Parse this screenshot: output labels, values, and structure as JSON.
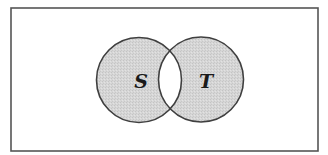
{
  "diagram": {
    "type": "venn",
    "universe": {
      "x": 11,
      "y": 8,
      "width": 307,
      "height": 143,
      "stroke": "#555555"
    },
    "sets": [
      {
        "id": "S",
        "label": "S",
        "cx": 139,
        "cy": 80,
        "r": 42.5
      },
      {
        "id": "T",
        "label": "T",
        "cx": 201,
        "cy": 79.5,
        "r": 42.5
      }
    ],
    "shaded_regions": [
      "S only",
      "T only"
    ],
    "unshaded_regions": [
      "S ∩ T",
      "outside S ∪ T"
    ],
    "colors": {
      "fill": "#d3d3d3",
      "stroke": "#3f3f3f",
      "background": "#ffffff",
      "intersection_fill": "#ffffff"
    }
  }
}
